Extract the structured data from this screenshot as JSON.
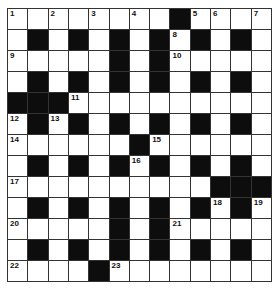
{
  "puzzle": {
    "rows": 13,
    "cols": 13,
    "colors": {
      "block": "#0d0d0d",
      "cell": "#ffffff",
      "border": "#333333"
    },
    "grid": [
      "1.2.3.4.#567.",
      ".#.#.#.#8#.#.",
      "9....#.#A....",
      ".#.#.#.#.#.#.",
      "###B.........",
      "C#D#.#.#.#.#.",
      "E.....#F.....",
      ".#.#.#G#.#.#.",
      "H.........###",
      ".#.#.#.#.#I#J",
      "K....#.#L....",
      ".#.#.#.#.#.#.",
      "M...#N......."
    ],
    "numbers": [
      {
        "r": 0,
        "c": 0,
        "n": "1"
      },
      {
        "r": 0,
        "c": 2,
        "n": "2"
      },
      {
        "r": 0,
        "c": 4,
        "n": "3"
      },
      {
        "r": 0,
        "c": 6,
        "n": "4"
      },
      {
        "r": 0,
        "c": 9,
        "n": "5"
      },
      {
        "r": 0,
        "c": 10,
        "n": "6"
      },
      {
        "r": 0,
        "c": 12,
        "n": "7"
      },
      {
        "r": 1,
        "c": 8,
        "n": "8"
      },
      {
        "r": 2,
        "c": 0,
        "n": "9"
      },
      {
        "r": 2,
        "c": 8,
        "n": "10"
      },
      {
        "r": 4,
        "c": 3,
        "n": "11"
      },
      {
        "r": 5,
        "c": 0,
        "n": "12"
      },
      {
        "r": 5,
        "c": 2,
        "n": "13"
      },
      {
        "r": 6,
        "c": 0,
        "n": "14"
      },
      {
        "r": 6,
        "c": 7,
        "n": "15"
      },
      {
        "r": 7,
        "c": 6,
        "n": "16"
      },
      {
        "r": 8,
        "c": 0,
        "n": "17"
      },
      {
        "r": 9,
        "c": 10,
        "n": "18"
      },
      {
        "r": 9,
        "c": 12,
        "n": "19"
      },
      {
        "r": 10,
        "c": 0,
        "n": "20"
      },
      {
        "r": 10,
        "c": 8,
        "n": "21"
      },
      {
        "r": 12,
        "c": 0,
        "n": "22"
      },
      {
        "r": 12,
        "c": 5,
        "n": "23"
      }
    ]
  }
}
